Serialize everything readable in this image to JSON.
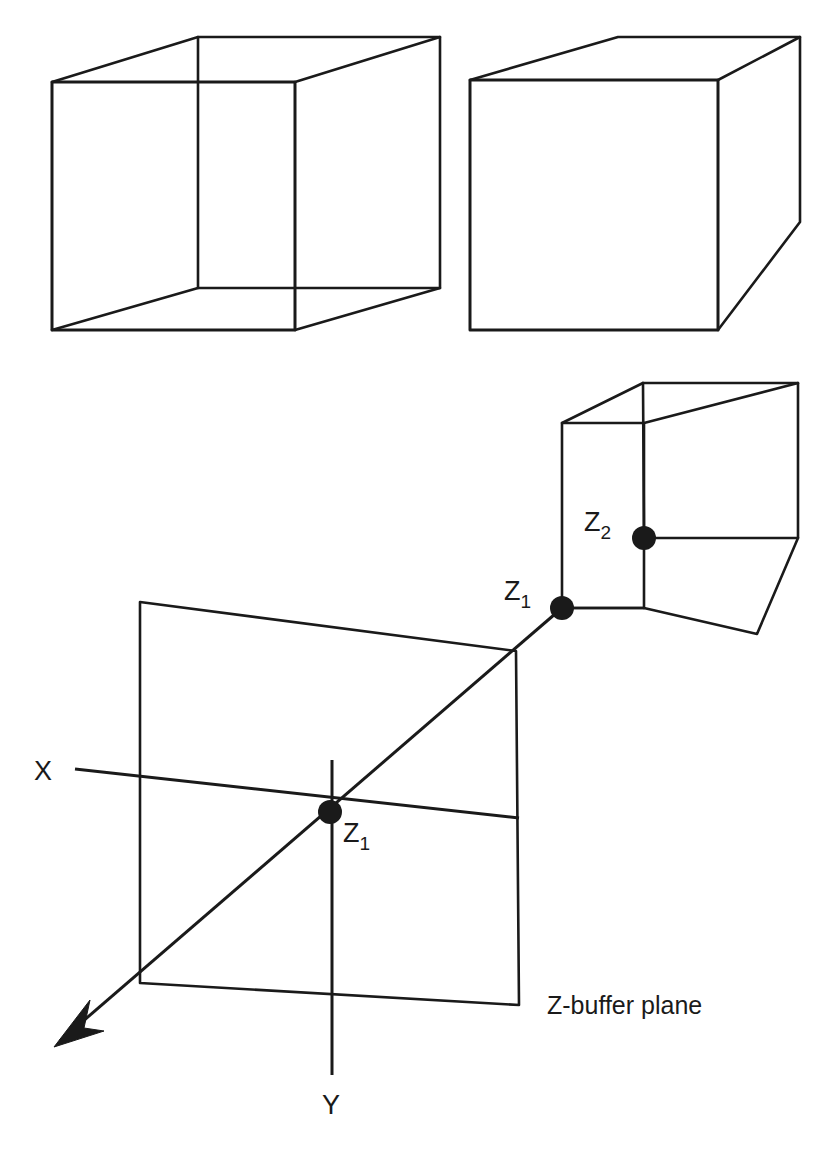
{
  "figure": {
    "background_color": "#ffffff",
    "stroke_color": "#1a1a1a",
    "width": 825,
    "height": 1149
  },
  "labels": {
    "axis_x": "X",
    "axis_y": "Y",
    "plane_caption": "Z-buffer plane",
    "z1_plane": "Z",
    "z1_plane_sub": "1",
    "z1_cube": "Z",
    "z1_cube_sub": "1",
    "z2_cube": "Z",
    "z2_cube_sub": "2"
  },
  "shapes": {
    "cube_top_left": {
      "name": "wireframe-cube-transparent",
      "front_face": [
        [
          52,
          82
        ],
        [
          295,
          82
        ],
        [
          295,
          330
        ],
        [
          52,
          330
        ]
      ],
      "back_face": [
        [
          198,
          37
        ],
        [
          440,
          37
        ],
        [
          440,
          288
        ],
        [
          198,
          288
        ]
      ],
      "connectors": [
        [
          [
            52,
            82
          ],
          [
            198,
            37
          ]
        ],
        [
          [
            295,
            82
          ],
          [
            440,
            37
          ]
        ],
        [
          [
            295,
            330
          ],
          [
            440,
            288
          ]
        ],
        [
          [
            52,
            330
          ],
          [
            198,
            288
          ]
        ]
      ]
    },
    "cube_top_right": {
      "name": "wireframe-cube-opaque",
      "front_face": [
        [
          470,
          80
        ],
        [
          718,
          80
        ],
        [
          718,
          330
        ],
        [
          470,
          330
        ]
      ],
      "visible_back": [
        [
          618,
          37
        ],
        [
          800,
          37
        ],
        [
          800,
          222
        ]
      ],
      "connectors": [
        [
          [
            470,
            80
          ],
          [
            618,
            37
          ]
        ],
        [
          [
            718,
            80
          ],
          [
            800,
            37
          ]
        ],
        [
          [
            718,
            330
          ],
          [
            800,
            222
          ]
        ]
      ]
    },
    "cube_small": {
      "name": "wireframe-cube-small",
      "front_face": [
        [
          562,
          423
        ],
        [
          644,
          423
        ],
        [
          644,
          608
        ],
        [
          562,
          608
        ]
      ],
      "back_face": [
        [
          643,
          383
        ],
        [
          798,
          383
        ],
        [
          798,
          538
        ],
        [
          643,
          538
        ]
      ],
      "connectors": [
        [
          [
            562,
            423
          ],
          [
            643,
            383
          ]
        ],
        [
          [
            644,
            423
          ],
          [
            798,
            383
          ]
        ],
        [
          [
            644,
            608
          ],
          [
            798,
            538
          ]
        ],
        [
          [
            562,
            608
          ],
          [
            643,
            568
          ]
        ]
      ],
      "lower_right": [
        [
          644,
          608
        ],
        [
          755,
          634
        ],
        [
          798,
          538
        ]
      ]
    },
    "plane": {
      "name": "z-buffer-plane-quad",
      "corners": [
        [
          140,
          602
        ],
        [
          516,
          651
        ],
        [
          519,
          1005
        ],
        [
          140,
          983
        ]
      ]
    },
    "axes": {
      "x_axis": [
        [
          75,
          769
        ],
        [
          519,
          818
        ]
      ],
      "y_axis": [
        [
          332,
          762
        ],
        [
          332,
          1075
        ]
      ],
      "z_axis_ray": [
        [
          140,
          983
        ],
        [
          562,
          608
        ]
      ],
      "z_arrow_tail": [
        [
          140,
          983
        ],
        [
          60,
          1040
        ]
      ],
      "z_arrow_tip": [
        55,
        1047
      ]
    },
    "dots": [
      {
        "name": "z1-plane-dot",
        "cx": 330,
        "cy": 812,
        "r": 11
      },
      {
        "name": "z1-cube-dot",
        "cx": 562,
        "cy": 608,
        "r": 11
      },
      {
        "name": "z2-cube-dot",
        "cx": 644,
        "cy": 538,
        "r": 11
      }
    ]
  },
  "label_positions": {
    "axis_x": [
      44,
      780
    ],
    "axis_y": [
      322,
      1113
    ],
    "plane_caption": [
      547,
      1013
    ],
    "z1_plane": [
      345,
      840
    ],
    "z1_cube": [
      508,
      598
    ],
    "z2_cube": [
      588,
      529
    ]
  }
}
